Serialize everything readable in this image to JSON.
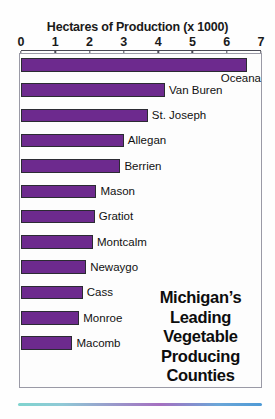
{
  "chart_data": {
    "type": "bar",
    "orientation": "horizontal",
    "title": "Hectares of Production (x 1000)",
    "xlabel": "Hectares of Production (x 1000)",
    "ylabel": "",
    "xlim": [
      0,
      7
    ],
    "grid": false,
    "legend": "none",
    "xticks": [
      "0",
      "1",
      "2",
      "3",
      "4",
      "5",
      "6",
      "7"
    ],
    "xtick_values": [
      0,
      1,
      2,
      3,
      4,
      5,
      6,
      7
    ],
    "categories": [
      "Oceana",
      "Van Buren",
      "St. Joseph",
      "Allegan",
      "Berrien",
      "Mason",
      "Gratiot",
      "Montcalm",
      "Newaygo",
      "Cass",
      "Monroe",
      "Macomb"
    ],
    "values": [
      6.6,
      4.2,
      3.7,
      3.0,
      2.9,
      2.2,
      2.15,
      2.1,
      1.9,
      1.8,
      1.7,
      1.5
    ],
    "bar_color": "#6d2a8e",
    "bar_edge_color": "#2b2b33",
    "annotations": [
      "Michigan's",
      "Leading",
      "Vegetable",
      "Producing",
      "Counties"
    ]
  },
  "callout": {
    "line1": "Michigan’s",
    "line2": "Leading",
    "line3": "Vegetable",
    "line4": "Producing",
    "line5": "Counties"
  },
  "colors": {
    "bar": "#6d2a8e",
    "bar_edge": "#2b2b33",
    "axis": "#4a4a55",
    "frame": "#9a9aa6",
    "text": "#111111",
    "background": "#fefefe"
  }
}
